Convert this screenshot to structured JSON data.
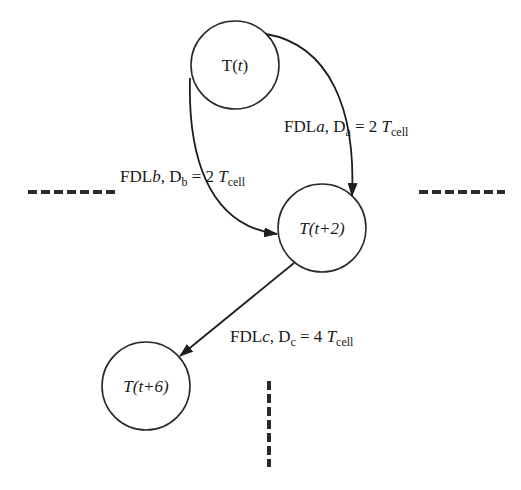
{
  "diagram": {
    "nodes": [
      {
        "id": "t0",
        "label_main": "T(",
        "label_var": "t",
        "label_end": ")",
        "italic_T": false,
        "cx": 235,
        "cy": 65,
        "r": 44
      },
      {
        "id": "t2",
        "label_main": "T",
        "label_paren": "(t+2)",
        "cx": 322,
        "cy": 228,
        "r": 44
      },
      {
        "id": "t6",
        "label_main": "T",
        "label_paren": "(t+6)",
        "cx": 146,
        "cy": 386,
        "r": 44
      }
    ],
    "edges": [
      {
        "id": "a",
        "from": "t0",
        "to": "t2",
        "fdl": "FDL",
        "fdl_var": "a",
        "d": "D",
        "d_sub": "a",
        "eq": " = 2 ",
        "t": "T",
        "t_sub": "cell"
      },
      {
        "id": "b",
        "from": "t0",
        "to": "t2",
        "fdl": "FDL",
        "fdl_var": "b",
        "d": "D",
        "d_sub": "b",
        "eq": " = 2 ",
        "t": "T",
        "t_sub": "cell"
      },
      {
        "id": "c",
        "from": "t2",
        "to": "t6",
        "fdl": "FDL",
        "fdl_var": "c",
        "d": "D",
        "d_sub": "c",
        "eq": " = 4 ",
        "t": "T",
        "t_sub": "cell"
      }
    ],
    "continuations": [
      "left-dashed",
      "right-dashed",
      "bottom-dashed"
    ],
    "colors": {
      "stroke": "#1e1e1e",
      "background": "#ffffff"
    }
  }
}
